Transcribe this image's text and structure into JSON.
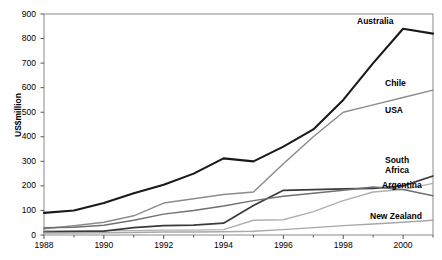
{
  "chart_data": {
    "type": "line",
    "title": "",
    "xlabel": "",
    "ylabel": "US$million",
    "xlim": [
      1988,
      2001
    ],
    "ylim": [
      0,
      900
    ],
    "ytick_step": 100,
    "grid": false,
    "legend_position": "inline-right-labels",
    "x": [
      1988,
      1989,
      1990,
      1991,
      1992,
      1993,
      1994,
      1995,
      1996,
      1997,
      1998,
      1999,
      2000,
      2001
    ],
    "xtick_labels": [
      "1988",
      "1990",
      "1992",
      "1994",
      "1996",
      "1998",
      "2000"
    ],
    "xtick_values": [
      1988,
      1990,
      1992,
      1994,
      1996,
      1998,
      2000
    ],
    "ytick_labels": [
      "0",
      "100",
      "200",
      "300",
      "400",
      "500",
      "600",
      "700",
      "800",
      "900"
    ],
    "ytick_values": [
      0,
      100,
      200,
      300,
      400,
      500,
      600,
      700,
      800,
      900
    ],
    "series": [
      {
        "name": "Australia",
        "color": "#1a1a1a",
        "width": 2.1,
        "label_x": 2000,
        "label_y": 880,
        "values": [
          90,
          100,
          130,
          170,
          205,
          250,
          312,
          300,
          360,
          430,
          550,
          700,
          840,
          820
        ]
      },
      {
        "name": "Chile",
        "color": "#8c8c8c",
        "width": 1.5,
        "label_x": 2000,
        "label_y": 620,
        "values": [
          25,
          38,
          52,
          78,
          130,
          148,
          165,
          175,
          290,
          400,
          500,
          530,
          560,
          590
        ]
      },
      {
        "name": "USA",
        "color": "#b0b0b0",
        "width": 1.4,
        "label_x": 2000,
        "label_y": 520,
        "values": [
          18,
          18,
          18,
          18,
          20,
          20,
          22,
          60,
          62,
          95,
          140,
          175,
          185,
          210
        ]
      },
      {
        "name": "South Africa",
        "color": "#3a3a3a",
        "width": 1.7,
        "label_x": 2000,
        "label_y": 250,
        "values": [
          12,
          14,
          16,
          30,
          38,
          40,
          48,
          120,
          182,
          185,
          188,
          190,
          200,
          240
        ]
      },
      {
        "name": "Argentina",
        "color": "#707070",
        "width": 1.5,
        "label_x": 2000,
        "label_y": 175,
        "values": [
          30,
          32,
          40,
          60,
          85,
          100,
          118,
          140,
          158,
          170,
          182,
          195,
          185,
          160
        ]
      },
      {
        "name": "New Zealand",
        "color": "#a8a8a8",
        "width": 1.4,
        "label_x": 2000,
        "label_y": 60,
        "values": [
          8,
          8,
          9,
          10,
          12,
          12,
          13,
          15,
          22,
          30,
          38,
          45,
          52,
          60
        ]
      }
    ]
  }
}
